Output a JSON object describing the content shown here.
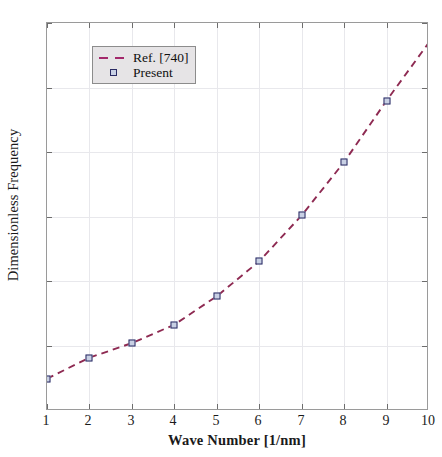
{
  "chart_data": {
    "type": "line",
    "title": "",
    "xlabel": "Wave Number [1/nm]",
    "ylabel": "Dimensionless Frequency",
    "xlim": [
      1,
      10
    ],
    "ylim": [
      0,
      12
    ],
    "xticks": [
      "1",
      "2",
      "3",
      "4",
      "5",
      "6",
      "7",
      "8",
      "9",
      "10"
    ],
    "xtick_values": [
      1,
      2,
      3,
      4,
      5,
      6,
      7,
      8,
      9,
      10
    ],
    "yticks": [
      "0",
      "2",
      "4",
      "6",
      "8",
      "10",
      "12"
    ],
    "ytick_values": [
      0,
      2,
      4,
      6,
      8,
      10,
      12
    ],
    "grid": true,
    "legend_position": "upper-left",
    "x": [
      1,
      2,
      3,
      4,
      5,
      6,
      7,
      8,
      9,
      10
    ],
    "series": [
      {
        "name": "Ref. [740]",
        "style": "dashed-line",
        "color": "#8e2a52",
        "values": [
          1.0,
          1.65,
          2.1,
          2.67,
          3.55,
          4.63,
          6.05,
          7.7,
          9.6,
          11.4
        ]
      },
      {
        "name": "Present",
        "style": "square-marker",
        "color": "#2a2a63",
        "fill": "#c8d0e4",
        "x": [
          1,
          2,
          3,
          4,
          5,
          6,
          7,
          8,
          9
        ],
        "values": [
          1.0,
          1.65,
          2.1,
          2.67,
          3.55,
          4.63,
          6.05,
          7.7,
          9.6
        ]
      }
    ]
  },
  "legend": {
    "entries": [
      {
        "label": "Ref. [740]",
        "key": "dashed-line-key"
      },
      {
        "label": "Present",
        "key": "square-marker-key"
      }
    ]
  },
  "axes": {
    "x_title": "Wave Number [1/nm]",
    "y_title": "Dimensionless Frequency"
  },
  "colors": {
    "line": "#8e2a52",
    "marker_edge": "#2a2a63",
    "marker_face": "#c8d0e4",
    "grid": "#e8e8ec",
    "frame": "#9a9a9a",
    "legend_bg": "#e6e4e6",
    "background": "#ffffff"
  }
}
